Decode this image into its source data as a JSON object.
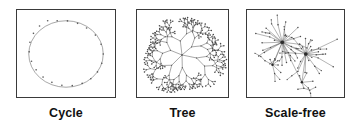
{
  "figure": {
    "background_color": "#ffffff",
    "panel_border_color": "#3a3a3a",
    "edge_color": "#5b5b5b",
    "node_color": "#4a4a4a",
    "caption_color": "#111111",
    "panels": [
      {
        "id": "cycle",
        "caption": "Cycle",
        "graph_type": "cycle",
        "node_count": 22,
        "description": "ring lattice, every node has degree 2"
      },
      {
        "id": "tree",
        "caption": "Tree",
        "graph_type": "tree",
        "description": "radial branching tree, acyclic, recursive bifurcation"
      },
      {
        "id": "scale-free",
        "caption": "Scale-free",
        "graph_type": "scale-free",
        "hub_count": 2,
        "description": "power-law degree distribution with dominant hubs"
      }
    ]
  },
  "chart_data": {
    "type": "diagram",
    "title": "",
    "panels": [
      {
        "label": "Cycle",
        "topology": "cycle",
        "nodes": 22,
        "edges": 22,
        "layout": "ellipse",
        "ellipse": {
          "cx": 50,
          "cy": 45,
          "rx": 38,
          "ry": 34
        }
      },
      {
        "label": "Tree",
        "topology": "tree",
        "layout": "radial",
        "root": {
          "x": 46,
          "y": 46
        },
        "branching_factor": 2,
        "depth": 6,
        "initial_branches": 6
      },
      {
        "label": "Scale-free",
        "topology": "scale-free",
        "layout": "force-directed",
        "hubs": [
          {
            "x": 36,
            "y": 33,
            "degree": 22
          },
          {
            "x": 60,
            "y": 45,
            "degree": 16
          }
        ],
        "secondary_hubs": [
          {
            "x": 26,
            "y": 56,
            "degree": 7
          },
          {
            "x": 56,
            "y": 74,
            "degree": 4
          }
        ]
      }
    ]
  }
}
